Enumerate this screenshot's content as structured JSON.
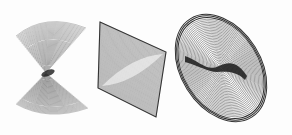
{
  "figure": {
    "background": "#fdfdfd",
    "ink_color": "#1a1a1a",
    "shapes": [
      {
        "name": "saddle-bowtie",
        "kind": "hourglass line envelope",
        "upper_lobe": {
          "left": [
            16,
            36
          ],
          "right": [
            86,
            28
          ],
          "pinch": [
            46,
            73
          ]
        },
        "lower_lobe": {
          "left": [
            16,
            104
          ],
          "right": [
            88,
            108
          ],
          "pinch": [
            46,
            73
          ]
        },
        "lines": 48
      },
      {
        "name": "rhombus-envelope",
        "kind": "parallelogram with inner lens",
        "vertices": [
          [
            100,
            22
          ],
          [
            166,
            52
          ],
          [
            156,
            117
          ],
          [
            98,
            88
          ]
        ],
        "lines": 60
      },
      {
        "name": "concentric-ellipse",
        "kind": "nested rotated ellipses with dark wavy band",
        "center": [
          221,
          68
        ],
        "rx": 40,
        "ry": 58,
        "rotation_deg": -32,
        "rings": 34
      }
    ]
  }
}
